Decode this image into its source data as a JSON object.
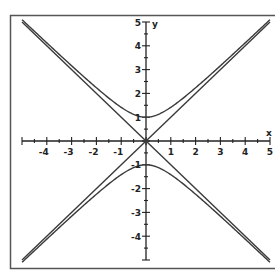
{
  "chart_data": {
    "type": "line",
    "title": "",
    "xlabel": "x",
    "ylabel": "y",
    "xlim": [
      -5,
      5
    ],
    "ylim": [
      -5,
      5
    ],
    "grid": false,
    "legend": null,
    "x_ticks": [
      -4,
      -3,
      -2,
      -1,
      1,
      2,
      3,
      4,
      5
    ],
    "y_ticks": [
      5,
      4,
      3,
      2,
      1,
      -1,
      -2,
      -3,
      -4
    ],
    "minor_tick_step": 0.5,
    "series": [
      {
        "name": "hyperbola upper branch (y = sqrt(1+x^2))",
        "kind": "hyperbola",
        "branch": 1,
        "x": [
          -5,
          -4,
          -3,
          -2,
          -1,
          0,
          1,
          2,
          3,
          4,
          5
        ],
        "values": [
          5.1,
          4.12,
          3.16,
          2.24,
          1.41,
          1,
          1.41,
          2.24,
          3.16,
          4.12,
          5.1
        ]
      },
      {
        "name": "hyperbola lower branch (y = -sqrt(1+x^2))",
        "kind": "hyperbola",
        "branch": -1,
        "x": [
          -5,
          -4,
          -3,
          -2,
          -1,
          0,
          1,
          2,
          3,
          4,
          5
        ],
        "values": [
          -5.1,
          -4.12,
          -3.16,
          -2.24,
          -1.41,
          -1,
          -1.41,
          -2.24,
          -3.16,
          -4.12,
          -5.1
        ]
      },
      {
        "name": "asymptote y = x",
        "kind": "line",
        "slope": 1,
        "x": [
          -5,
          5
        ],
        "values": [
          -5,
          5
        ]
      },
      {
        "name": "asymptote y = -x",
        "kind": "line",
        "slope": -1,
        "x": [
          -5,
          5
        ],
        "values": [
          5,
          -5
        ]
      }
    ],
    "vertices": [
      [
        0,
        1
      ],
      [
        0,
        -1
      ]
    ]
  },
  "style": {
    "line_color": "#3a3a3a",
    "axis_color": "#222222",
    "frame_color": "#555555",
    "background": "#ffffff"
  },
  "labels": {
    "x_axis": "x",
    "y_axis": "y"
  }
}
